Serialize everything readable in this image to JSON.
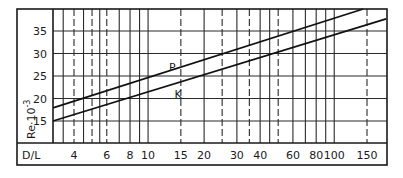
{
  "chart_data": {
    "type": "line",
    "title": "",
    "xlabel": "D/L",
    "ylabel": "Re·10⁻³",
    "ylabel_parts": {
      "base": "Re·10",
      "exp": "-3"
    },
    "x_scale": "log",
    "xlim": [
      3,
      190
    ],
    "ylim": [
      10,
      40
    ],
    "grid": true,
    "x_ticks": [
      4,
      6,
      8,
      10,
      15,
      20,
      30,
      40,
      60,
      80,
      100,
      150
    ],
    "x_tick_labels": [
      "4",
      "6",
      "8",
      "10",
      "15",
      "20",
      "30",
      "40",
      "60",
      "80",
      "100",
      "150"
    ],
    "y_ticks": [
      15,
      20,
      25,
      30,
      35
    ],
    "y_tick_labels": [
      "15",
      "20",
      "25",
      "30",
      "35"
    ],
    "vertical_gridlines": [
      {
        "x": 3.5,
        "style": "solid"
      },
      {
        "x": 4,
        "style": "dashed"
      },
      {
        "x": 4.5,
        "style": "solid"
      },
      {
        "x": 5,
        "style": "dashed"
      },
      {
        "x": 5.5,
        "style": "solid"
      },
      {
        "x": 6,
        "style": "dashed"
      },
      {
        "x": 7,
        "style": "solid"
      },
      {
        "x": 8,
        "style": "solid"
      },
      {
        "x": 9,
        "style": "solid"
      },
      {
        "x": 10,
        "style": "solid"
      },
      {
        "x": 15,
        "style": "dashed"
      },
      {
        "x": 20,
        "style": "solid"
      },
      {
        "x": 25,
        "style": "dashed"
      },
      {
        "x": 30,
        "style": "solid"
      },
      {
        "x": 35,
        "style": "dashed"
      },
      {
        "x": 40,
        "style": "solid"
      },
      {
        "x": 45,
        "style": "solid"
      },
      {
        "x": 50,
        "style": "dashed"
      },
      {
        "x": 60,
        "style": "solid"
      },
      {
        "x": 70,
        "style": "solid"
      },
      {
        "x": 80,
        "style": "solid"
      },
      {
        "x": 90,
        "style": "solid"
      },
      {
        "x": 100,
        "style": "solid"
      },
      {
        "x": 150,
        "style": "dashed"
      }
    ],
    "series": [
      {
        "name": "P",
        "x": [
          3,
          143
        ],
        "values": [
          17.9,
          39.9
        ]
      },
      {
        "name": "K",
        "x": [
          3,
          190
        ],
        "values": [
          15.0,
          37.7
        ]
      }
    ],
    "annotations": [
      {
        "text": "P",
        "x": 13.5,
        "y": 27
      },
      {
        "text": "K",
        "x": 14.5,
        "y": 21
      }
    ]
  }
}
